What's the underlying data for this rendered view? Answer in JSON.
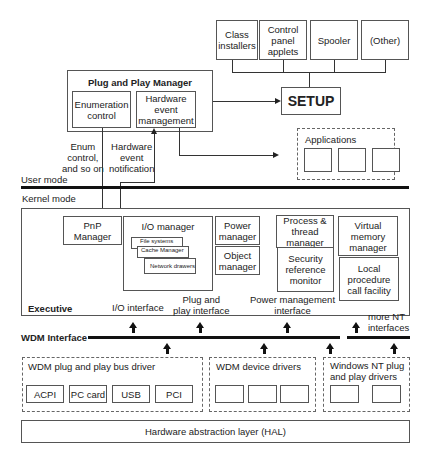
{
  "top_boxes": [
    {
      "label": "Class\ninstallers"
    },
    {
      "label": "Control\npanel\napplets"
    },
    {
      "label": "Spooler"
    },
    {
      "label": "(Other)"
    }
  ],
  "setup": {
    "label": "SETUP"
  },
  "pnp_manager": {
    "title": "Plug and Play Manager",
    "enumeration": "Enumeration\ncontrol",
    "hw_event_mgmt": "Hardware\nevent\nmanagement"
  },
  "applications": {
    "label": "Applications"
  },
  "edge_labels": {
    "enum_control": "Enum\ncontrol,\nand so on",
    "hw_event_notification": "Hardware\nevent\nnotification"
  },
  "modes": {
    "user": "User mode",
    "kernel": "Kernel mode"
  },
  "executive": {
    "label": "Executive",
    "pnp": "PnP\nManager",
    "io_manager": {
      "title": "I/O manager",
      "stack": [
        "File systems",
        "Cache Manager",
        "Network drawers"
      ]
    },
    "power": "Power\nmanager",
    "object": "Object\nmanager",
    "process": "Process &\nthread\nmanager",
    "security": "Security\nreference\nmonitor",
    "virtual_memory": "Virtual\nmemory\nmanager",
    "lpc": "Local\nprocedure\ncall facility"
  },
  "interfaces": {
    "io": "I/O interface",
    "pnp": "Plug and\nplay interface",
    "power": "Power management\ninterface",
    "more_nt": "more NT\ninterfaces",
    "wdm": "WDM Interface"
  },
  "drivers": {
    "bus": {
      "label": "WDM plug and play bus driver",
      "items": [
        "ACPI",
        "PC card",
        "USB",
        "PCI"
      ]
    },
    "device": {
      "label": "WDM device drivers"
    },
    "nt": {
      "label": "Windows NT plug\nand play drivers"
    }
  },
  "hal": {
    "label": "Hardware abstraction layer (HAL)"
  }
}
